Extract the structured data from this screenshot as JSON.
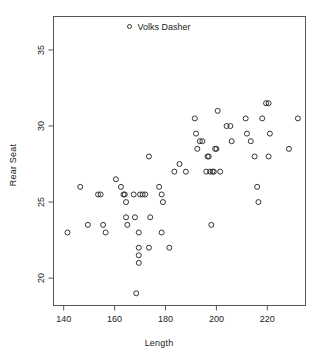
{
  "chart_data": {
    "type": "scatter",
    "title": "Volks Dasher",
    "xlabel": "Length",
    "ylabel": "Rear Seat",
    "xlim": [
      136,
      235
    ],
    "ylim": [
      18.2,
      37.2
    ],
    "xticks": [
      140,
      160,
      180,
      200,
      220
    ],
    "yticks": [
      20,
      25,
      30,
      35
    ],
    "grid": false,
    "legend": {
      "position": "top-center",
      "entries": [
        {
          "label": "Volks Dasher",
          "marker": "open-circle"
        }
      ]
    },
    "marker": {
      "shape": "open-circle",
      "edge_color": "#333333",
      "fill": "none",
      "size_px": 5
    },
    "series": [
      {
        "name": "Volks Dasher",
        "points": [
          [
            141.5,
            23.0
          ],
          [
            146.5,
            26.0
          ],
          [
            149.5,
            23.5
          ],
          [
            153.5,
            25.5
          ],
          [
            154.5,
            25.5
          ],
          [
            155.5,
            23.5
          ],
          [
            156.5,
            23.0
          ],
          [
            160.5,
            26.5
          ],
          [
            162.5,
            26.0
          ],
          [
            163.5,
            25.5
          ],
          [
            164.0,
            25.5
          ],
          [
            164.5,
            25.0
          ],
          [
            164.5,
            24.0
          ],
          [
            165.0,
            23.5
          ],
          [
            167.5,
            25.5
          ],
          [
            168.0,
            24.0
          ],
          [
            168.5,
            19.0
          ],
          [
            169.5,
            22.0
          ],
          [
            169.5,
            21.5
          ],
          [
            169.5,
            21.0
          ],
          [
            169.5,
            23.0
          ],
          [
            170.0,
            25.5
          ],
          [
            171.0,
            25.5
          ],
          [
            172.0,
            25.5
          ],
          [
            173.5,
            22.0
          ],
          [
            173.5,
            28.0
          ],
          [
            174.0,
            24.0
          ],
          [
            177.5,
            26.0
          ],
          [
            178.5,
            25.5
          ],
          [
            178.5,
            23.0
          ],
          [
            179.0,
            25.0
          ],
          [
            181.5,
            22.0
          ],
          [
            183.5,
            27.0
          ],
          [
            185.5,
            27.5
          ],
          [
            188.0,
            27.0
          ],
          [
            191.5,
            30.5
          ],
          [
            192.0,
            29.5
          ],
          [
            192.5,
            28.5
          ],
          [
            193.5,
            29.0
          ],
          [
            194.5,
            29.0
          ],
          [
            196.0,
            27.0
          ],
          [
            196.5,
            28.0
          ],
          [
            197.0,
            28.0
          ],
          [
            197.5,
            27.0
          ],
          [
            198.0,
            23.5
          ],
          [
            198.5,
            27.0
          ],
          [
            199.0,
            27.0
          ],
          [
            199.5,
            28.5
          ],
          [
            200.0,
            28.5
          ],
          [
            200.5,
            31.0
          ],
          [
            201.5,
            27.0
          ],
          [
            204.0,
            30.0
          ],
          [
            205.5,
            30.0
          ],
          [
            206.0,
            29.0
          ],
          [
            211.5,
            30.5
          ],
          [
            212.0,
            29.5
          ],
          [
            213.5,
            29.0
          ],
          [
            215.0,
            28.0
          ],
          [
            216.0,
            26.0
          ],
          [
            216.5,
            25.0
          ],
          [
            218.0,
            30.5
          ],
          [
            219.5,
            31.5
          ],
          [
            220.5,
            31.5
          ],
          [
            220.5,
            28.0
          ],
          [
            221.0,
            29.5
          ],
          [
            228.5,
            28.5
          ],
          [
            232.0,
            30.5
          ]
        ]
      }
    ]
  }
}
